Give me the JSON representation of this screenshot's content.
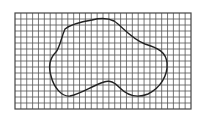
{
  "diagram": {
    "type": "grid-area-estimation",
    "background": "#ffffff",
    "grid": {
      "x": 15,
      "y": 13,
      "width": 176,
      "height": 96,
      "columns": 30,
      "rows": 16,
      "line_color": "#555555",
      "border_color": "#444444"
    },
    "shape": {
      "stroke": "#222222",
      "stroke_width": 1.4,
      "path": "M 65 29 C 70 25, 80 22, 92 20 C 100 18, 108 18, 114 21 C 122 26, 130 38, 145 44 C 158 48, 166 52, 167 63 C 168 76, 160 88, 148 94 C 138 98, 128 96, 120 88 C 114 82, 110 80, 104 82 C 92 86, 80 94, 70 96 C 62 97, 54 88, 51 76 C 48 66, 50 58, 56 52 C 60 47, 61 38, 65 29 Z"
    }
  }
}
